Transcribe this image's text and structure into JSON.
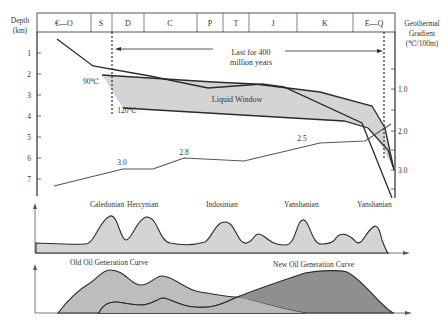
{
  "left_axis": {
    "title_line1": "Depth",
    "title_line2": "(km)",
    "ticks": [
      "1",
      "2",
      "3",
      "4",
      "5",
      "6",
      "7"
    ]
  },
  "right_axis": {
    "title_line1": "Geothermal",
    "title_line2": "Gradient",
    "title_line3": "(℃/100m)",
    "ticks": [
      "1.0",
      "2.0",
      "3.0"
    ]
  },
  "periods": [
    "€—O",
    "S",
    "D",
    "C",
    "P",
    "T",
    "J",
    "K",
    "E—Q"
  ],
  "annotations": {
    "duration_line1": "Last for 400",
    "duration_line2": "million years",
    "temp_90": "90℃",
    "temp_120": "120℃",
    "liquid_window": "Liquid Window"
  },
  "gradient_labels": [
    "3.0",
    "2.8",
    "2.5"
  ],
  "tectonic_events": [
    "Caledonian",
    "Hercynian",
    "Indosinian",
    "Yanshanian",
    "Yanshanian"
  ],
  "generation_curves": {
    "old": "Old Oil Generation Curve",
    "new": "New Oil Generation Curve"
  },
  "colors": {
    "line": "#2b2b2b",
    "light_fill": "#d4d4d4",
    "mid_fill": "#bdbdbd",
    "dark_fill": "#8f8f8f",
    "gradient_line": "#555555"
  }
}
